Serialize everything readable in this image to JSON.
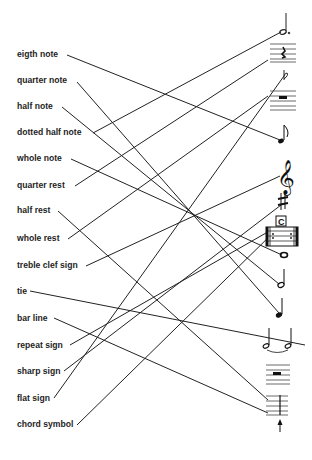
{
  "worksheet": {
    "labels": [
      {
        "id": "eigth-note",
        "text": "eigth note",
        "y": 49
      },
      {
        "id": "quarter-note",
        "text": "quarter note",
        "y": 75
      },
      {
        "id": "half-note",
        "text": "half note",
        "y": 101
      },
      {
        "id": "dotted-half-note",
        "text": "dotted half note",
        "y": 127
      },
      {
        "id": "whole-note",
        "text": "whole note",
        "y": 153
      },
      {
        "id": "quarter-rest",
        "text": "quarter rest",
        "y": 180
      },
      {
        "id": "half-rest",
        "text": "half rest",
        "y": 205
      },
      {
        "id": "whole-rest",
        "text": "whole rest",
        "y": 233
      },
      {
        "id": "treble-clef-sign",
        "text": "treble clef sign",
        "y": 260
      },
      {
        "id": "tie",
        "text": "tie",
        "y": 286
      },
      {
        "id": "bar-line",
        "text": "bar line",
        "y": 313
      },
      {
        "id": "repeat-sign",
        "text": "repeat sign",
        "y": 340
      },
      {
        "id": "sharp-sign",
        "text": "sharp sign",
        "y": 366
      },
      {
        "id": "flat-sign",
        "text": "flat sign",
        "y": 393
      },
      {
        "id": "chord-symbol",
        "text": "chord symbol",
        "y": 419
      }
    ],
    "symbols": [
      "dotted-half-note-symbol",
      "quarter-rest-symbol",
      "flat-symbol",
      "whole-rest-symbol",
      "eighth-note-symbol",
      "treble-clef-symbol",
      "sharp-symbol",
      "chord-symbol-C",
      "repeat-sign-symbol",
      "whole-note-symbol",
      "half-note-symbol",
      "quarter-note-symbol",
      "tie-symbol",
      "half-rest-symbol",
      "bar-line-symbol"
    ],
    "chord_letter": "C",
    "connections": [
      {
        "from": "eigth note",
        "to": "eighth-note-symbol",
        "x1": 67,
        "y1": 55,
        "x2": 280,
        "y2": 140
      },
      {
        "from": "quarter note",
        "to": "quarter-note-symbol",
        "x1": 77,
        "y1": 82,
        "x2": 279,
        "y2": 313
      },
      {
        "from": "half note",
        "to": "half-note-symbol",
        "x1": 62,
        "y1": 107,
        "x2": 279,
        "y2": 284
      },
      {
        "from": "dotted half note",
        "to": "dotted-half-note-symbol",
        "x1": 93,
        "y1": 133,
        "x2": 281,
        "y2": 32
      },
      {
        "from": "whole note",
        "to": "whole-note-symbol",
        "x1": 71,
        "y1": 159,
        "x2": 282,
        "y2": 255
      },
      {
        "from": "quarter rest",
        "to": "quarter-rest-symbol",
        "x1": 75,
        "y1": 186,
        "x2": 268,
        "y2": 60
      },
      {
        "from": "half rest",
        "to": "half-rest-symbol",
        "x1": 58,
        "y1": 211,
        "x2": 268,
        "y2": 400
      },
      {
        "from": "whole rest",
        "to": "whole-rest-symbol",
        "x1": 68,
        "y1": 239,
        "x2": 268,
        "y2": 96
      },
      {
        "from": "treble clef sign",
        "to": "treble-clef-symbol",
        "x1": 86,
        "y1": 266,
        "x2": 280,
        "y2": 176
      },
      {
        "from": "tie",
        "to": "tie-symbol",
        "x1": 30,
        "y1": 291,
        "x2": 305,
        "y2": 345
      },
      {
        "from": "bar line",
        "to": "bar-line-symbol",
        "x1": 54,
        "y1": 318,
        "x2": 268,
        "y2": 413
      },
      {
        "from": "repeat sign",
        "to": "repeat-sign-symbol",
        "x1": 70,
        "y1": 345,
        "x2": 266,
        "y2": 233
      },
      {
        "from": "sharp sign",
        "to": "sharp-symbol",
        "x1": 64,
        "y1": 371,
        "x2": 281,
        "y2": 205
      },
      {
        "from": "flat sign",
        "to": "flat-symbol",
        "x1": 54,
        "y1": 398,
        "x2": 284,
        "y2": 76
      },
      {
        "from": "chord symbol",
        "to": "chord-symbol-C",
        "x1": 77,
        "y1": 425,
        "x2": 276,
        "y2": 230
      }
    ]
  }
}
